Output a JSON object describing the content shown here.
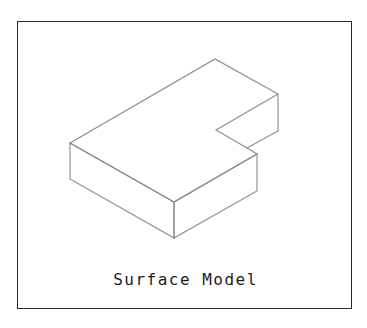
{
  "figure": {
    "caption": "Surface Model",
    "frame_color": "#2a2a2a",
    "edge_color": "#8a8a8a"
  },
  "model": {
    "type": "L-shaped block, isometric view",
    "vertices": {
      "top_back": [
        215,
        59
      ],
      "top_right": [
        278,
        94
      ],
      "notch_inner": [
        216,
        130
      ],
      "notch_corner": [
        247,
        148
      ],
      "top_right_lower": [
        257,
        154
      ],
      "top_front": [
        174,
        202
      ],
      "top_left": [
        70,
        143
      ],
      "bottom_left": [
        70,
        179
      ],
      "bottom_front": [
        174,
        238
      ],
      "bottom_right_lower": [
        257,
        191
      ],
      "bottom_right_upper": [
        278,
        131
      ]
    }
  }
}
